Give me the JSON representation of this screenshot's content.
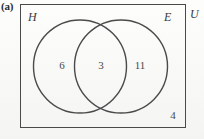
{
  "figure": {
    "part_label": "(a)",
    "type": "venn-diagram",
    "universal_set_label": "U",
    "sets": [
      {
        "id": "H",
        "label": "H",
        "position": "left"
      },
      {
        "id": "E",
        "label": "E",
        "position": "right"
      }
    ],
    "regions": [
      {
        "id": "H-only",
        "label": "6",
        "description": "only-H"
      },
      {
        "id": "H-and-E",
        "label": "3",
        "description": "intersection"
      },
      {
        "id": "E-only",
        "label": "11",
        "description": "only-E"
      },
      {
        "id": "outside",
        "label": "4",
        "description": "outside-both-circles"
      }
    ],
    "colors": {
      "ink": "#4a4a4a",
      "text": "#3a3a3a",
      "paper": "#fbfbfa"
    }
  }
}
